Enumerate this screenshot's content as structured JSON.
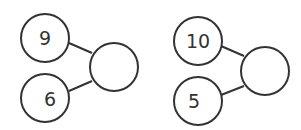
{
  "diagrams": [
    {
      "name": "number-bond-1",
      "parts": [
        {
          "label": "9"
        },
        {
          "label": "6"
        }
      ],
      "whole": {
        "label": ""
      }
    },
    {
      "name": "number-bond-2",
      "parts": [
        {
          "label": "10"
        },
        {
          "label": "5"
        }
      ],
      "whole": {
        "label": ""
      }
    }
  ],
  "colors": {
    "stroke": "#333333",
    "fill": "#ffffff"
  }
}
